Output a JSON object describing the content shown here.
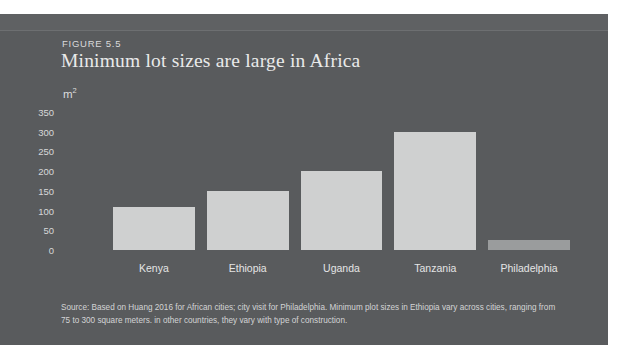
{
  "figure": {
    "label": "FIGURE 5.5",
    "title": "Minimum lot sizes are large in Africa",
    "unit_label": "m",
    "unit_exponent": "2",
    "source_note": "Source: Based on Huang 2016 for African cities; city visit for Philadelphia. Minimum plot sizes in Ethiopia vary across cities, ranging from 75 to 300 square meters. in other countries, they vary with type of construction."
  },
  "colors": {
    "panel_background": "#595b5d",
    "panel_top_band": "#5f6163",
    "bar_fill": "#cfd0d0",
    "bar_fill_dim": "#9a9c9d",
    "title_text": "#e9eaea",
    "axis_text": "#d7d8d9",
    "page_background": "#ffffff"
  },
  "chart_data": {
    "type": "bar",
    "title": "Minimum lot sizes are large in Africa",
    "xlabel": "",
    "ylabel": "m2",
    "ylim": [
      0,
      350
    ],
    "yticks": [
      0,
      50,
      100,
      150,
      200,
      250,
      300,
      350
    ],
    "ytick_labels": [
      "0",
      "50",
      "100",
      "150",
      "200",
      "250",
      "300",
      "350"
    ],
    "grid": false,
    "legend": null,
    "categories": [
      "Kenya",
      "Ethiopia",
      "Uganda",
      "Tanzania",
      "Philadelphia"
    ],
    "values": [
      110,
      150,
      200,
      300,
      25
    ],
    "bar_styles": [
      "normal",
      "normal",
      "normal",
      "normal",
      "dim"
    ]
  }
}
